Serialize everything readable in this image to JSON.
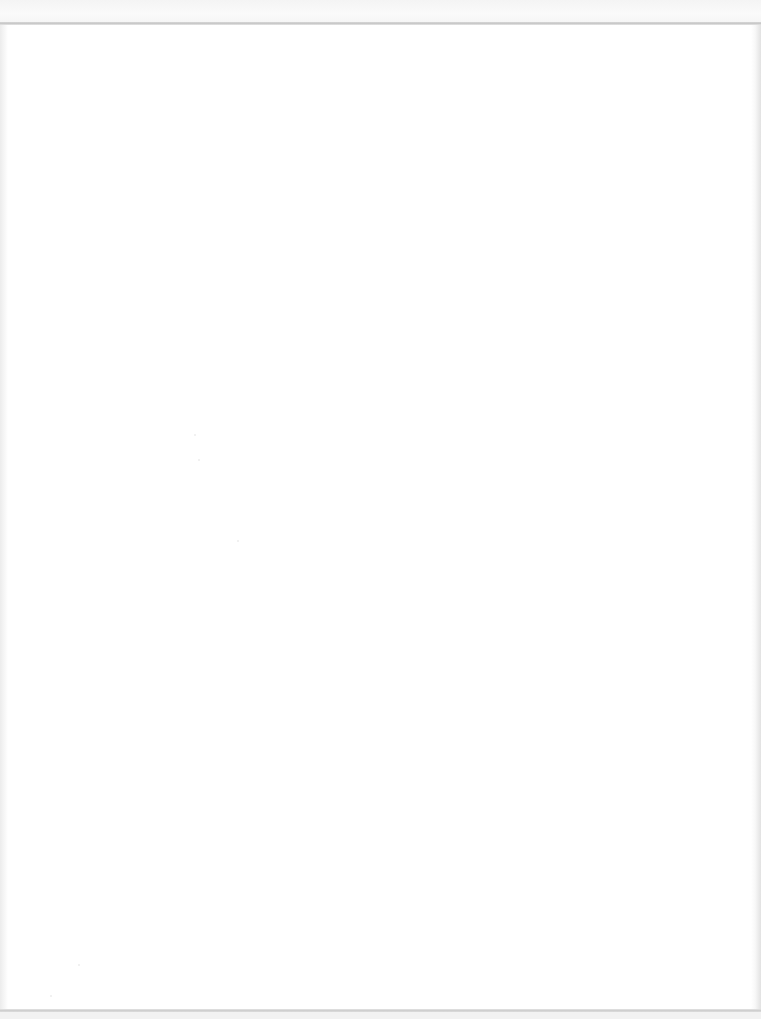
{
  "document": {
    "type": "blank-scanned-page",
    "text": "",
    "colors": {
      "paper": "#ffffff",
      "scan_border": "#cfcfcf",
      "edge_shade": "#e6e6e6"
    }
  }
}
